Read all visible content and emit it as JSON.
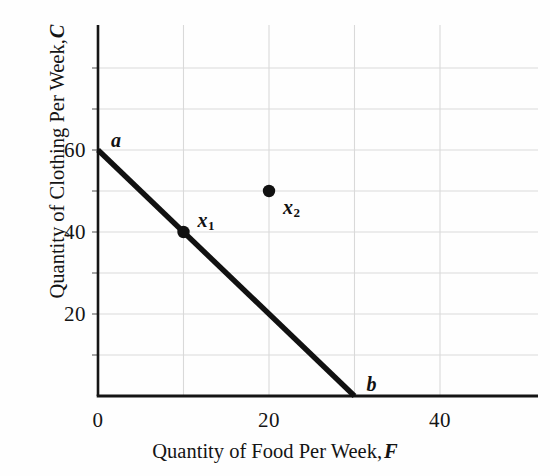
{
  "chart_data": {
    "type": "line",
    "title": "",
    "xlabel": "Quantity of Food Per Week, F",
    "ylabel": "Quantity of Clothing Per Week, C",
    "xlabel_text": "Quantity of Food Per Week,",
    "xlabel_symbol": "F",
    "ylabel_text": "Quantity of Clothing Per Week,",
    "ylabel_symbol": "C",
    "xlim": [
      0,
      50
    ],
    "ylim": [
      0,
      87
    ],
    "grid": true,
    "grid_color": "#d9d9d9",
    "axis_color": "#151515",
    "line_color": "#111111",
    "xticks": [
      {
        "value": 0,
        "label": "0"
      },
      {
        "value": 20,
        "label": "20"
      },
      {
        "value": 40,
        "label": "40"
      }
    ],
    "yticks": [
      {
        "value": 20,
        "label": "20"
      },
      {
        "value": 40,
        "label": "40"
      },
      {
        "value": 60,
        "label": "60"
      }
    ],
    "xgrid_values": [
      10,
      20,
      30,
      40
    ],
    "ygrid_values": [
      10,
      20,
      30,
      40,
      50,
      60,
      70,
      80
    ],
    "series": [
      {
        "name": "budget-line",
        "type": "line",
        "endpoints": [
          {
            "x": 0,
            "y": 60,
            "label": "a"
          },
          {
            "x": 30,
            "y": 0,
            "label": "b"
          }
        ]
      }
    ],
    "points": [
      {
        "name": "x1",
        "label": "x",
        "subscript": "1",
        "x": 10,
        "y": 40,
        "on_line": true,
        "label_offset": {
          "dx": 14,
          "dy": -22
        }
      },
      {
        "name": "x2",
        "label": "x",
        "subscript": "2",
        "x": 20,
        "y": 50,
        "on_line": false,
        "label_offset": {
          "dx": 14,
          "dy": 6
        }
      }
    ],
    "annotations": [
      {
        "name": "point-a-label",
        "text": "a",
        "x": 0,
        "y": 60,
        "dx": 13,
        "dy": -20
      },
      {
        "name": "point-b-label",
        "text": "b",
        "x": 30,
        "y": 0,
        "dx": 12,
        "dy": -22
      }
    ]
  }
}
